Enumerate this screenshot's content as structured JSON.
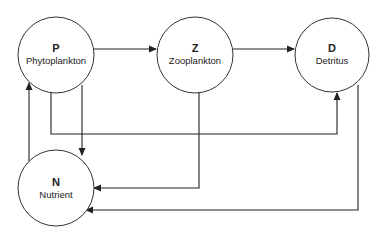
{
  "diagram": {
    "type": "flow",
    "nodes": [
      {
        "id": "P",
        "letter": "P",
        "name": "Phytoplankton"
      },
      {
        "id": "Z",
        "letter": "Z",
        "name": "Zooplankton"
      },
      {
        "id": "D",
        "letter": "D",
        "name": "Detritus"
      },
      {
        "id": "N",
        "letter": "N",
        "name": "Nutrient"
      }
    ],
    "edges": [
      {
        "from": "P",
        "to": "Z"
      },
      {
        "from": "Z",
        "to": "D"
      },
      {
        "from": "N",
        "to": "P"
      },
      {
        "from": "P",
        "to": "N"
      },
      {
        "from": "P",
        "to": "D"
      },
      {
        "from": "Z",
        "to": "N"
      },
      {
        "from": "D",
        "to": "N"
      }
    ],
    "colors": {
      "stroke": "#222222",
      "fill": "#ffffff",
      "text": "#222222"
    }
  }
}
